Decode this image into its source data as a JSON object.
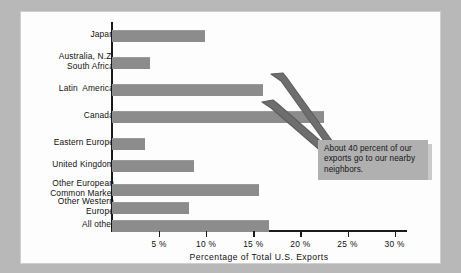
{
  "chart_data": {
    "type": "bar",
    "orientation": "horizontal",
    "title": "",
    "xlabel": "Percentage of Total U.S. Exports",
    "ylabel": "",
    "xlim": [
      0,
      32
    ],
    "grid": false,
    "legend": "none",
    "xticks": [
      "5 %",
      "10 %",
      "15 %",
      "20 %",
      "25 %",
      "30 %"
    ],
    "xtick_values": [
      5,
      10,
      15,
      20,
      25,
      30
    ],
    "categories": [
      "Japan",
      "Australia, N.Z.\nSouth Africa",
      "Latin  America",
      "Canada",
      "Eastern Europe",
      "United Kingdom",
      "Other European\nCommon Market",
      "Other Western\nEurope",
      "All other"
    ],
    "values": [
      9.9,
      4.0,
      16.0,
      22.5,
      3.5,
      8.7,
      15.6,
      8.2,
      16.7
    ],
    "annotations": [
      {
        "text": "About 40 percent of our exports go to our nearby neighbors.",
        "points_to": [
          "Latin  America",
          "Canada"
        ]
      }
    ],
    "bar_color": "#8c8c8c",
    "background_color": "#fdfdfd",
    "frame_color": "#b8b8b8",
    "annotation_color": "#b0b0b0"
  },
  "axis": {
    "x_title": "Percentage of Total  U.S.  Exports"
  },
  "annotation": {
    "line1": "About 40 percent of our",
    "line2": "exports go to our nearby",
    "line3": "neighbors."
  }
}
